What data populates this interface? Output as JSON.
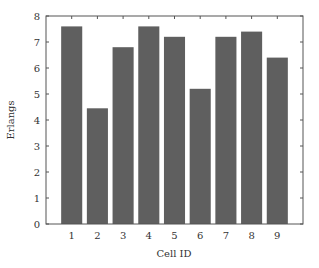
{
  "chart_data": {
    "type": "bar",
    "title": "",
    "xlabel": "Cell ID",
    "ylabel": "Erlangs",
    "categories": [
      "1",
      "2",
      "3",
      "4",
      "5",
      "6",
      "7",
      "8",
      "9"
    ],
    "values": [
      7.6,
      4.45,
      6.8,
      7.6,
      7.2,
      5.2,
      7.2,
      7.4,
      6.4
    ],
    "ylim": [
      0,
      8
    ],
    "yticks": [
      0,
      1,
      2,
      3,
      4,
      5,
      6,
      7,
      8
    ],
    "grid": false,
    "legend": null,
    "bar_color": "#5f5f5f",
    "axis_color": "#555555"
  }
}
